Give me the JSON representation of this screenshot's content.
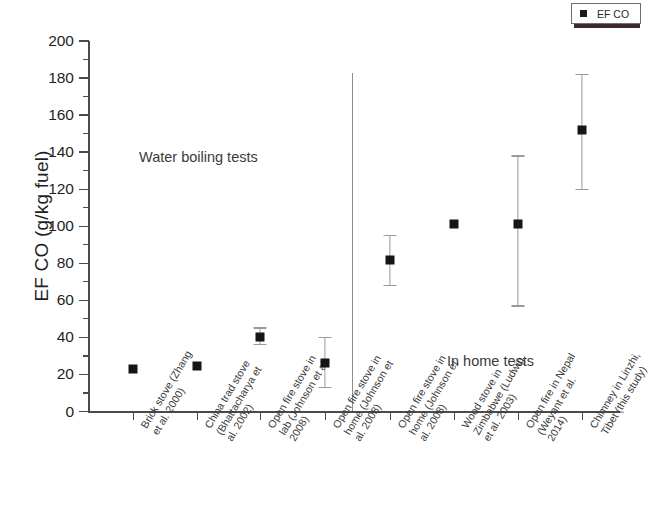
{
  "legend": {
    "label": "EF CO",
    "marker_color": "#151515"
  },
  "axes": {
    "ylabel": "EF CO (g/kg fuel)",
    "yticks": [
      0,
      20,
      40,
      60,
      80,
      100,
      120,
      140,
      160,
      180,
      200
    ]
  },
  "annotations": {
    "left_group": "Water boiling tests",
    "right_group": "In home tests"
  },
  "categories": [
    [
      "Brick stove (Zhang",
      "et al. 2000)"
    ],
    [
      "China trad stove",
      "(Bhattacharya et",
      "al. 2002)"
    ],
    [
      "Open fire stove in",
      "lab (Johnson et al.",
      "2008)"
    ],
    [
      "Open fire stove in",
      "home (Johnson et",
      "al. 2008)"
    ],
    [
      "Open fire stove in",
      "home (Johnson et",
      "al. 2008)"
    ],
    [
      "Wood stove in",
      "Zimbabwe (Ludwig",
      "et al. 2003)"
    ],
    [
      "Open fire in Nepal",
      "(Weyant et al.",
      "2014)"
    ],
    [
      "Chimney in Linzhi,",
      "Tibet (this study)"
    ]
  ],
  "chart_data": {
    "type": "scatter",
    "title": "",
    "xlabel": "",
    "ylabel": "EF CO (g/kg fuel)",
    "ylim": [
      0,
      200
    ],
    "ytick_step": 20,
    "grid": false,
    "legend_position": "top-right",
    "categories": [
      "Brick stove (Zhang et al. 2000)",
      "China trad stove (Bhattacharya et al. 2002)",
      "Open fire stove in lab (Johnson et al. 2008)",
      "Open fire stove in home (Johnson et al. 2008)",
      "Open fire stove in home (Johnson et al. 2008)",
      "Wood stove in Zimbabwe (Ludwig et al. 2003)",
      "Open fire in Nepal (Weyant et al. 2014)",
      "Chimney in Linzhi, Tibet (this study)"
    ],
    "series": [
      {
        "name": "EF CO",
        "values": [
          23,
          24.5,
          40,
          26,
          82,
          101,
          101,
          152
        ],
        "err_low": [
          null,
          null,
          36,
          13,
          68,
          null,
          57,
          120
        ],
        "err_high": [
          null,
          null,
          45,
          40,
          95,
          null,
          138,
          182
        ]
      }
    ],
    "groups": [
      {
        "label": "Water boiling tests",
        "category_indices": [
          0,
          1,
          2,
          3
        ]
      },
      {
        "label": "In home tests",
        "category_indices": [
          4,
          5,
          6,
          7
        ]
      }
    ]
  }
}
